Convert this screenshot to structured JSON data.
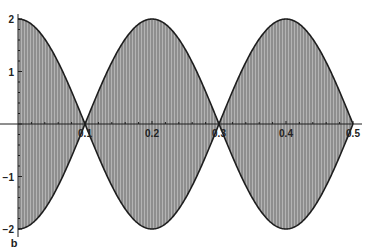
{
  "chart_data": {
    "type": "area",
    "title": "",
    "panel_label": "b",
    "xlabel": "",
    "ylabel": "",
    "xlim": [
      0,
      0.5
    ],
    "ylim": [
      -2,
      2
    ],
    "x_ticks": [
      0.1,
      0.2,
      0.3,
      0.4,
      0.5
    ],
    "x_tick_labels": [
      "0.1",
      "0.2",
      "0.3",
      "0.4",
      "0.5"
    ],
    "y_ticks": [
      2,
      1,
      -1,
      -2
    ],
    "y_tick_labels": [
      "2",
      "1",
      "−1",
      "−2"
    ],
    "grid": false,
    "legend": null,
    "series": [
      {
        "name": "upper envelope",
        "x": [
          0,
          0.05,
          0.1,
          0.15,
          0.2,
          0.25,
          0.3,
          0.35,
          0.4,
          0.45,
          0.5
        ],
        "values": [
          2,
          1.41,
          0,
          1.41,
          2,
          1.41,
          0,
          1.41,
          2,
          1.41,
          0
        ]
      },
      {
        "name": "lower envelope",
        "x": [
          0,
          0.05,
          0.1,
          0.15,
          0.2,
          0.25,
          0.3,
          0.35,
          0.4,
          0.45,
          0.5
        ],
        "values": [
          -2,
          -1.41,
          0,
          -1.41,
          -2,
          -1.41,
          0,
          -1.41,
          -2,
          -1.41,
          0
        ]
      }
    ],
    "colors": {
      "fill": "#8c8c8c",
      "stripe": "#b0b0b0",
      "outline": "#1e1e1e",
      "axis": "#1e1e1e"
    }
  }
}
